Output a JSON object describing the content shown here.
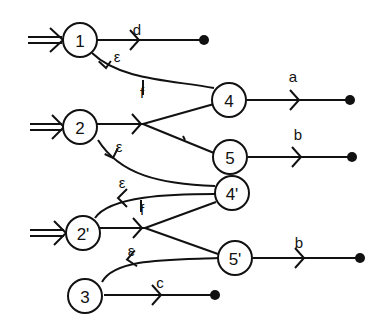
{
  "diagram": {
    "type": "automaton",
    "nodes": [
      {
        "id": "1",
        "label": "1",
        "initial": true
      },
      {
        "id": "2",
        "label": "2",
        "initial": true
      },
      {
        "id": "2p",
        "label": "2'",
        "initial": true
      },
      {
        "id": "3",
        "label": "3",
        "initial": false
      },
      {
        "id": "4",
        "label": "4",
        "initial": false
      },
      {
        "id": "5",
        "label": "5",
        "initial": false
      },
      {
        "id": "4p",
        "label": "4'",
        "initial": false
      },
      {
        "id": "5p",
        "label": "5'",
        "initial": false
      }
    ],
    "edges": [
      {
        "from": "1",
        "to": "end",
        "label": "d"
      },
      {
        "from": "4",
        "to": "1",
        "label": "ε"
      },
      {
        "from": "4",
        "to": "1",
        "label": "f",
        "note": "label on return arc"
      },
      {
        "from": "2",
        "to": "4",
        "label": ""
      },
      {
        "from": "2",
        "to": "5",
        "label": ""
      },
      {
        "from": "4'",
        "to": "2",
        "label": "ε"
      },
      {
        "from": "4'",
        "to": "2'",
        "label": "ε"
      },
      {
        "from": "4'",
        "to": "2'",
        "label": "f"
      },
      {
        "from": "2'",
        "to": "4'",
        "label": ""
      },
      {
        "from": "2'",
        "to": "5'",
        "label": ""
      },
      {
        "from": "5'",
        "to": "3",
        "label": "ε"
      },
      {
        "from": "4",
        "to": "end",
        "label": "a"
      },
      {
        "from": "5",
        "to": "end",
        "label": "b"
      },
      {
        "from": "5'",
        "to": "end",
        "label": "b"
      },
      {
        "from": "3",
        "to": "end",
        "label": "c"
      }
    ]
  },
  "labels": {
    "n1": "1",
    "n2": "2",
    "n2p": "2'",
    "n3": "3",
    "n4": "4",
    "n5": "5",
    "n4p": "4'",
    "n5p": "5'",
    "d": "d",
    "a": "a",
    "b1": "b",
    "b2": "b",
    "c": "c",
    "eps1": "ε",
    "eps2": "ε",
    "eps3": "ε",
    "eps4": "ε",
    "f1": "f",
    "f2": "f"
  }
}
